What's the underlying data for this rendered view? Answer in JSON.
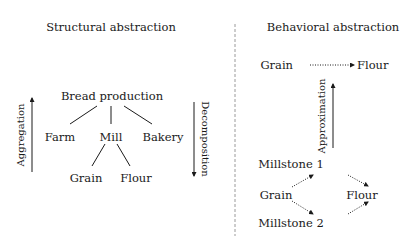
{
  "structural": {
    "title": "Structural abstraction",
    "root": "Bread production",
    "level1": [
      "Farm",
      "Mill",
      "Bakery"
    ],
    "level2": [
      "Grain",
      "Flour"
    ],
    "up_label": "Aggregation",
    "down_label": "Decomposition"
  },
  "behavioral": {
    "title": "Behavioral abstraction",
    "top_flow": {
      "from": "Grain",
      "to": "Flour"
    },
    "up_label": "Approximation",
    "bottom_flow": {
      "source": "Grain",
      "upper": "Millstone 1",
      "lower": "Millstone 2",
      "sink": "Flour"
    }
  },
  "colors": {
    "ink": "#1a1a1a",
    "divider": "#9a9a9a",
    "background": "#ffffff"
  }
}
